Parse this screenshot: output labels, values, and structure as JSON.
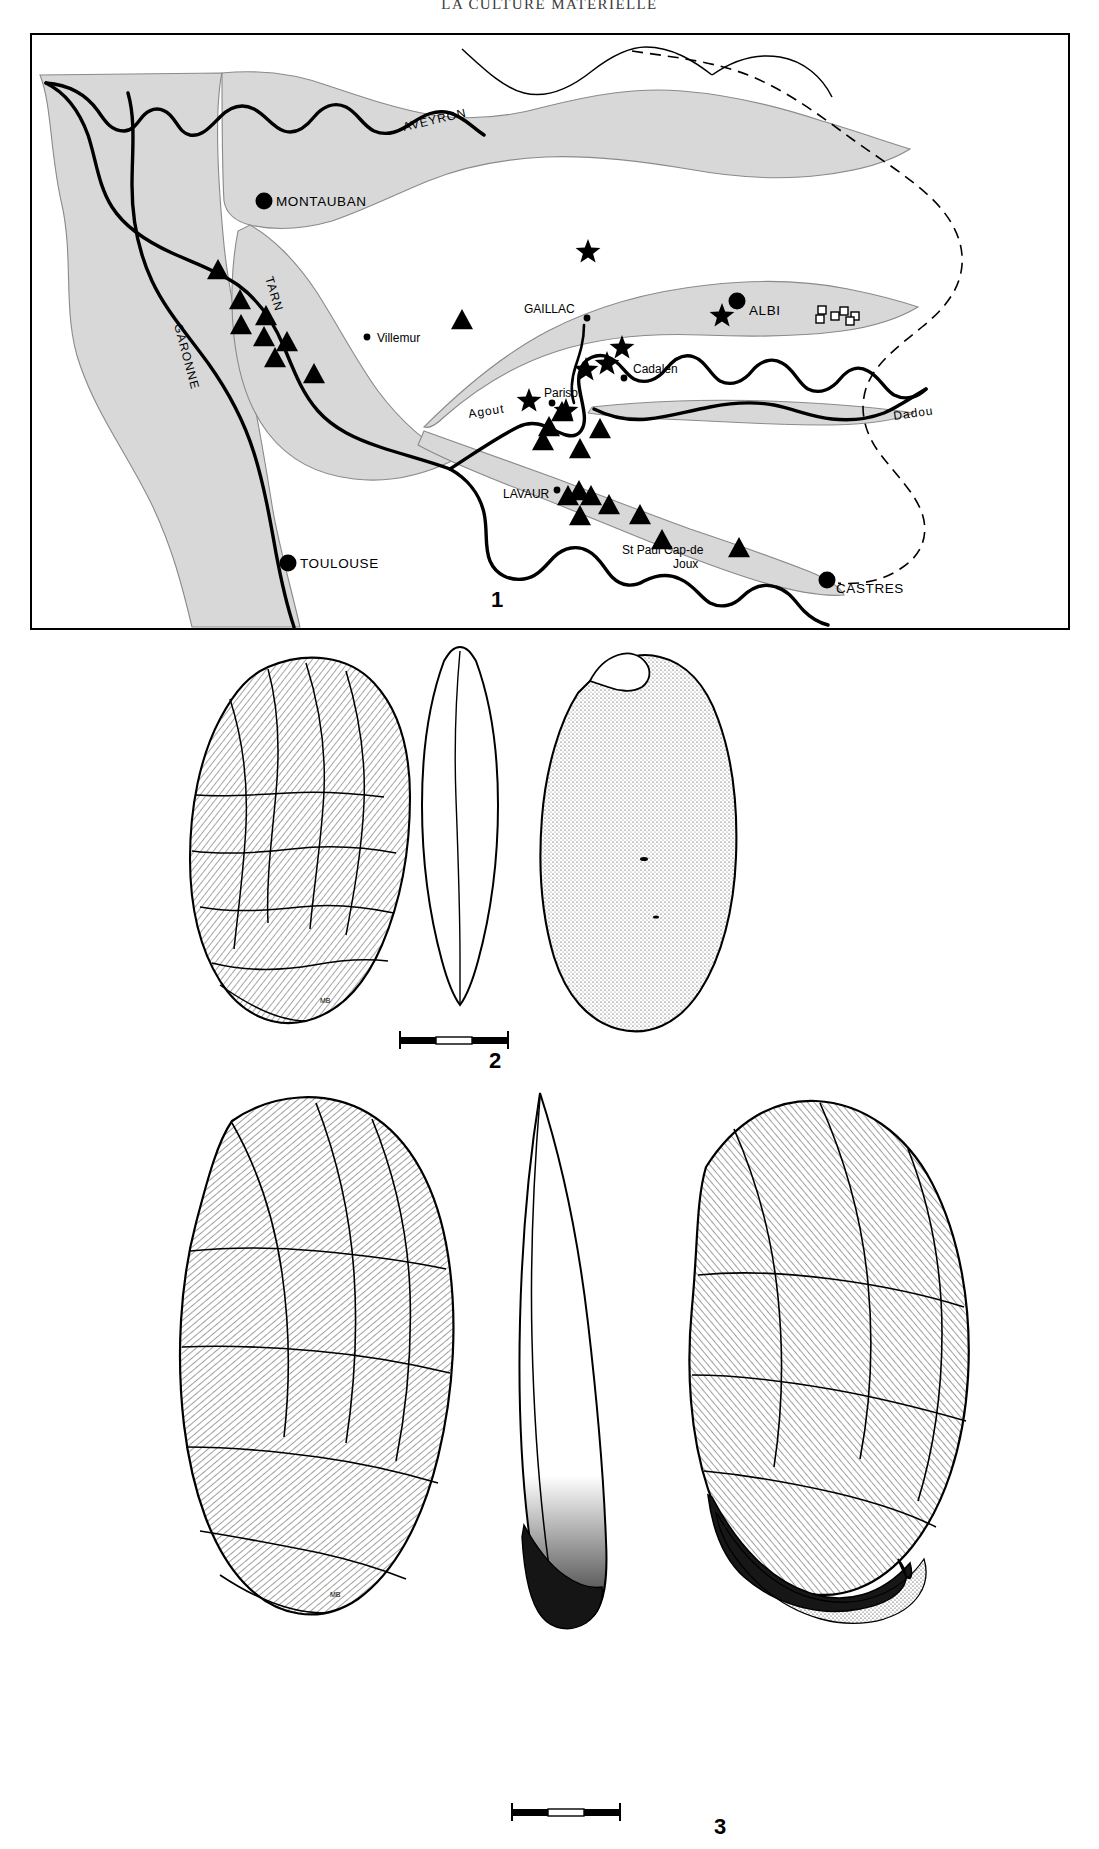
{
  "running_head": "LA  CULTURE  MATERIELLE",
  "figure": {
    "panels": [
      {
        "number": "1",
        "type": "distribution-map"
      },
      {
        "number": "2",
        "type": "lithic-biface-drawing"
      },
      {
        "number": "3",
        "type": "lithic-tool-drawing"
      }
    ]
  },
  "map": {
    "caption_number": "1",
    "cities_major": [
      {
        "name": "MONTAUBAN",
        "x": 232,
        "y": 166,
        "label_dx": 12,
        "label_dy": 5,
        "marker": "filled-circle"
      },
      {
        "name": "ALBI",
        "x": 705,
        "y": 266,
        "label_dx": 12,
        "label_dy": 14,
        "marker": "filled-circle"
      },
      {
        "name": "TOULOUSE",
        "x": 256,
        "y": 528,
        "label_dx": 12,
        "label_dy": 5,
        "marker": "filled-circle"
      },
      {
        "name": "CASTRES",
        "x": 795,
        "y": 545,
        "label_dx": 9,
        "label_dy": 13,
        "marker": "filled-circle"
      }
    ],
    "cities_minor": [
      {
        "name": "GAILLAC",
        "x": 555,
        "y": 283,
        "label_dx": -63,
        "label_dy": -5,
        "marker": "small-dot"
      },
      {
        "name": "Villemur",
        "x": 335,
        "y": 302,
        "label_dx": 10,
        "label_dy": 5,
        "marker": "small-dot"
      },
      {
        "name": "Cadalen",
        "x": 592,
        "y": 343,
        "label_dx": 9,
        "label_dy": -5,
        "marker": "small-dot"
      },
      {
        "name": "Parisot",
        "x": 520,
        "y": 368,
        "label_dx": -8,
        "label_dy": -6,
        "marker": "small-dot"
      },
      {
        "name": "LAVAUR",
        "x": 525,
        "y": 455,
        "label_dx": -54,
        "label_dy": 8,
        "marker": "small-dot"
      }
    ],
    "place_multiline": [
      {
        "name": "St Paul Cap-de",
        "x": 590,
        "y": 519
      },
      {
        "name": "Joux",
        "x": 641,
        "y": 533
      }
    ],
    "rivers": [
      {
        "name": "AVEYRON",
        "x": 372,
        "y": 96,
        "rotate": -13
      },
      {
        "name": "TARN",
        "x": 233,
        "y": 243,
        "rotate": 73
      },
      {
        "name": "GARONNE",
        "x": 142,
        "y": 290,
        "rotate": 75
      },
      {
        "name": "Agout",
        "x": 437,
        "y": 383,
        "rotate": -9
      },
      {
        "name": "Dadou",
        "x": 862,
        "y": 385,
        "rotate": -8
      }
    ],
    "markers": {
      "triangle": {
        "symbol": "filled-triangle",
        "points": [
          [
            186,
            235
          ],
          [
            208,
            265
          ],
          [
            209,
            290
          ],
          [
            234,
            281
          ],
          [
            232,
            302
          ],
          [
            255,
            307
          ],
          [
            243,
            323
          ],
          [
            282,
            339
          ],
          [
            430,
            285
          ],
          [
            517,
            392
          ],
          [
            511,
            406
          ],
          [
            530,
            377
          ],
          [
            548,
            414
          ],
          [
            568,
            394
          ],
          [
            608,
            480
          ],
          [
            536,
            461
          ],
          [
            547,
            456
          ],
          [
            559,
            461
          ],
          [
            548,
            481
          ],
          [
            577,
            470
          ],
          [
            630,
            505
          ],
          [
            707,
            513
          ]
        ]
      },
      "star": {
        "symbol": "filled-star",
        "points": [
          [
            556,
            217
          ],
          [
            690,
            281
          ],
          [
            590,
            313
          ],
          [
            575,
            329
          ],
          [
            554,
            335
          ],
          [
            534,
            376
          ],
          [
            497,
            366
          ]
        ]
      },
      "square": {
        "symbol": "open-square",
        "points": [
          [
            790,
            275
          ],
          [
            803,
            281
          ],
          [
            812,
            276
          ],
          [
            823,
            281
          ],
          [
            788,
            284
          ],
          [
            818,
            286
          ]
        ]
      }
    }
  },
  "tool2": {
    "caption_number": "2",
    "views": [
      "dorsal-face",
      "profile-section",
      "ventral-face"
    ],
    "scale_bar": {
      "segments": 2
    }
  },
  "tool3": {
    "caption_number": "3",
    "views": [
      "dorsal-face",
      "profile-section",
      "ventral-face"
    ],
    "scale_bar": {
      "segments": 2
    }
  },
  "colors": {
    "ink": "#000000",
    "valley_fill": "#d8d8d8",
    "valley_stroke": "#6e6e6e",
    "paper": "#ffffff"
  }
}
